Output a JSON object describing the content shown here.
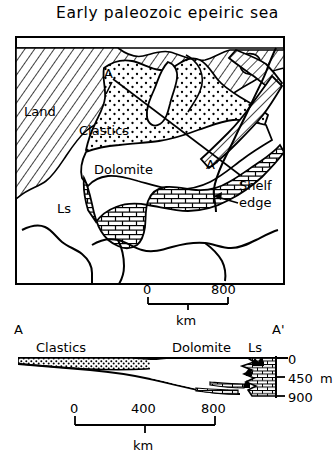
{
  "figure": {
    "title": "Early paleozoic epeiric sea",
    "kind": "paleogeographic-map-with-cross-section"
  },
  "map": {
    "labels": {
      "land": "Land",
      "clastics": "Clastics",
      "dolomite": "Dolomite",
      "limestone": "Ls",
      "section_start": "A",
      "section_end": "A'",
      "shelf_edge_line1": "Shelf",
      "shelf_edge_line2": "edge"
    },
    "scale": {
      "ticks": [
        "0",
        "800"
      ],
      "unit": "km"
    }
  },
  "section": {
    "labels": {
      "left_end": "A",
      "right_end": "A'",
      "clastics": "Clastics",
      "dolomite": "Dolomite",
      "limestone": "Ls"
    },
    "depth_axis": {
      "ticks": [
        "0",
        "450",
        "900"
      ],
      "unit": "m",
      "unit_on_tick": "450"
    },
    "scale": {
      "ticks": [
        "0",
        "400",
        "800"
      ],
      "unit": "km"
    }
  },
  "colors": {
    "ink": "#000000",
    "paper": "#ffffff"
  }
}
